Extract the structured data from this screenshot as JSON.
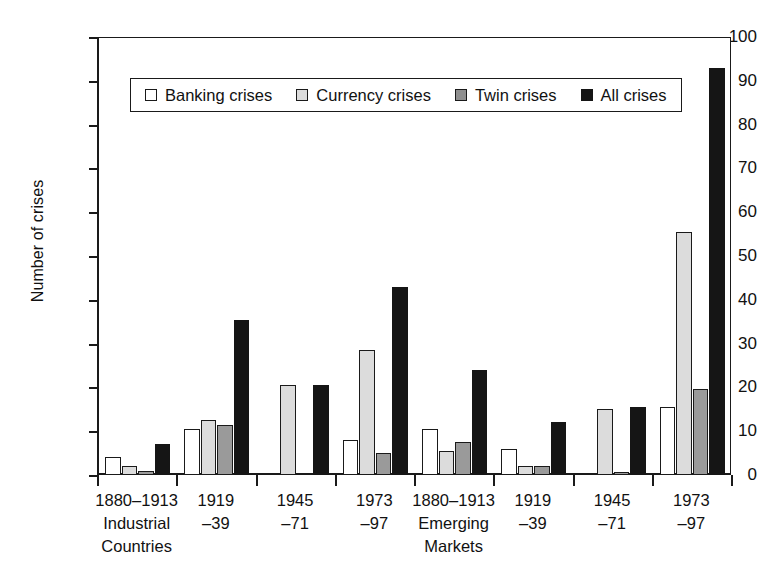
{
  "chart_data": {
    "type": "bar",
    "title": "",
    "xlabel": "",
    "ylabel": "Number of crises",
    "ylim": [
      0,
      100
    ],
    "yticks": [
      0,
      10,
      20,
      30,
      40,
      50,
      60,
      70,
      80,
      90,
      100
    ],
    "grid": true,
    "legend_position": "top-left-inside",
    "categories": [
      "1880–1913 Industrial Countries",
      "1919–39",
      "1945–71",
      "1973–97",
      "1880–1913 Emerging Markets",
      "1919–39",
      "1945–71",
      "1973–97"
    ],
    "category_lines": [
      {
        "l1": "1880–1913",
        "l2": "Industrial",
        "l3": "Countries"
      },
      {
        "l1": "1919",
        "l2": "–39",
        "l3": ""
      },
      {
        "l1": "1945",
        "l2": "–71",
        "l3": ""
      },
      {
        "l1": "1973",
        "l2": "–97",
        "l3": ""
      },
      {
        "l1": "1880–1913",
        "l2": "Emerging",
        "l3": "Markets"
      },
      {
        "l1": "1919",
        "l2": "–39",
        "l3": ""
      },
      {
        "l1": "1945",
        "l2": "–71",
        "l3": ""
      },
      {
        "l1": "1973",
        "l2": "–97",
        "l3": ""
      }
    ],
    "series": [
      {
        "name": "Banking crises",
        "color": "#ffffff",
        "values": [
          4,
          10.5,
          0,
          8,
          10.5,
          6,
          0,
          15.5
        ]
      },
      {
        "name": "Currency crises",
        "color": "#dcdcdc",
        "values": [
          2,
          12.5,
          20.5,
          28.5,
          5.5,
          2,
          15,
          55.5
        ]
      },
      {
        "name": "Twin crises",
        "color": "#9a9a9a",
        "values": [
          1,
          11.5,
          0,
          5,
          7.5,
          2,
          0.7,
          19.7
        ]
      },
      {
        "name": "All crises",
        "color": "#151515",
        "values": [
          7,
          35.5,
          20.5,
          43,
          24,
          12,
          15.5,
          93
        ]
      }
    ]
  },
  "legend": {
    "items": [
      {
        "label": "Banking crises",
        "swatch": "white-square"
      },
      {
        "label": "Currency crises",
        "swatch": "light-gray-square"
      },
      {
        "label": "Twin crises",
        "swatch": "gray-square"
      },
      {
        "label": "All crises",
        "swatch": "black-square"
      }
    ]
  }
}
